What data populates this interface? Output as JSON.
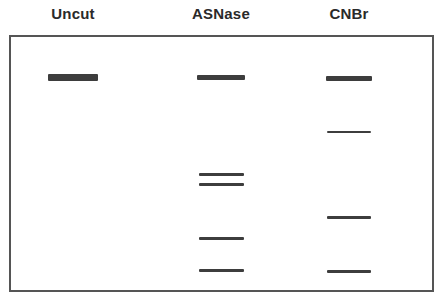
{
  "lanes": [
    {
      "label": "Uncut",
      "center_x": 73,
      "bands": [
        {
          "x": 48,
          "y": 74,
          "w": 50,
          "h": 7
        }
      ]
    },
    {
      "label": "ASNase",
      "center_x": 221,
      "bands": [
        {
          "x": 197,
          "y": 75,
          "w": 48,
          "h": 5
        },
        {
          "x": 199,
          "y": 173,
          "w": 45,
          "h": 3
        },
        {
          "x": 199,
          "y": 183,
          "w": 45,
          "h": 3
        },
        {
          "x": 199,
          "y": 237,
          "w": 45,
          "h": 3
        },
        {
          "x": 199,
          "y": 269,
          "w": 45,
          "h": 3
        }
      ]
    },
    {
      "label": "CNBr",
      "center_x": 349,
      "bands": [
        {
          "x": 326,
          "y": 76,
          "w": 46,
          "h": 5
        },
        {
          "x": 327,
          "y": 131,
          "w": 44,
          "h": 2
        },
        {
          "x": 327,
          "y": 216,
          "w": 44,
          "h": 3
        },
        {
          "x": 327,
          "y": 270,
          "w": 44,
          "h": 3
        }
      ]
    }
  ],
  "colors": {
    "band": "#3d3d3d",
    "border": "#555555",
    "label": "#2a2a2a"
  }
}
